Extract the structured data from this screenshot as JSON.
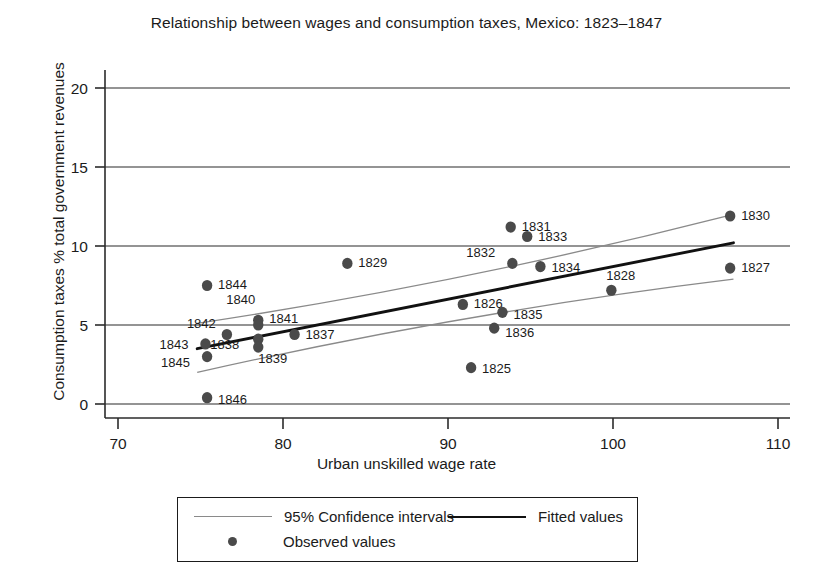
{
  "chart_data": {
    "type": "scatter",
    "title": "Relationship between wages and consumption taxes, Mexico: 1823–1847",
    "xlabel": "Urban unskilled wage rate",
    "ylabel": "Consumption taxes % total government revenues",
    "xlim": [
      70,
      110
    ],
    "ylim": [
      0,
      20
    ],
    "xticks": [
      "70",
      "80",
      "90",
      "100",
      "110"
    ],
    "yticks": [
      "0",
      "5",
      "10",
      "15",
      "20"
    ],
    "grid": "horizontal",
    "legend_position": "below-axes",
    "point_color": "#4a4a4a",
    "fit_color": "#111111",
    "ci_color": "#8a8a8a",
    "points": [
      {
        "label": "1825",
        "x": 91.4,
        "y": 2.3
      },
      {
        "label": "1826",
        "x": 90.9,
        "y": 6.3
      },
      {
        "label": "1827",
        "x": 107.1,
        "y": 8.6
      },
      {
        "label": "1828",
        "x": 99.9,
        "y": 7.2
      },
      {
        "label": "1829",
        "x": 83.9,
        "y": 8.9
      },
      {
        "label": "1830",
        "x": 107.1,
        "y": 11.9
      },
      {
        "label": "1831",
        "x": 93.8,
        "y": 11.2
      },
      {
        "label": "1832",
        "x": 93.9,
        "y": 8.9
      },
      {
        "label": "1833",
        "x": 94.8,
        "y": 10.6
      },
      {
        "label": "1834",
        "x": 95.6,
        "y": 8.7
      },
      {
        "label": "1835",
        "x": 93.3,
        "y": 5.8
      },
      {
        "label": "1836",
        "x": 92.8,
        "y": 4.8
      },
      {
        "label": "1837",
        "x": 80.7,
        "y": 4.4
      },
      {
        "label": "1838",
        "x": 78.5,
        "y": 4.1
      },
      {
        "label": "1839",
        "x": 78.5,
        "y": 3.6
      },
      {
        "label": "1840",
        "x": 78.5,
        "y": 5.3
      },
      {
        "label": "1841",
        "x": 78.5,
        "y": 5.0
      },
      {
        "label": "1842",
        "x": 76.6,
        "y": 4.4
      },
      {
        "label": "1843",
        "x": 75.3,
        "y": 3.8
      },
      {
        "label": "1844",
        "x": 75.4,
        "y": 7.5
      },
      {
        "label": "1845",
        "x": 75.4,
        "y": 3.0
      },
      {
        "label": "1846",
        "x": 75.4,
        "y": 0.4
      }
    ],
    "label_offsets": {
      "1825": [
        11,
        5
      ],
      "1826": [
        11,
        4
      ],
      "1827": [
        11,
        4
      ],
      "1828": [
        -5,
        -10
      ],
      "1829": [
        11,
        4
      ],
      "1830": [
        11,
        4
      ],
      "1831": [
        11,
        4
      ],
      "1832": [
        -46,
        -6
      ],
      "1833": [
        11,
        4
      ],
      "1834": [
        11,
        5
      ],
      "1835": [
        11,
        7
      ],
      "1836": [
        11,
        9
      ],
      "1837": [
        11,
        5
      ],
      "1838": [
        -48,
        10
      ],
      "1839": [
        0,
        16
      ],
      "1840": [
        -32,
        -16
      ],
      "1841": [
        11,
        -2
      ],
      "1842": [
        -40,
        -6
      ],
      "1843": [
        -46,
        5
      ],
      "1844": [
        11,
        3
      ],
      "1845": [
        -46,
        10
      ],
      "1846": [
        11,
        6
      ]
    },
    "fitted_line": {
      "x1": 74.8,
      "y1": 3.5,
      "x2": 107.3,
      "y2": 10.2
    },
    "ci_upper": {
      "x1": 74.8,
      "y1": 5.1,
      "x2": 107.3,
      "y2": 12.0
    },
    "ci_lower": {
      "x1": 74.8,
      "y1": 2.0,
      "x2": 107.3,
      "y2": 7.9
    },
    "legend": [
      {
        "key": "ci",
        "marker": "line-thin",
        "label": "95% Confidence intervals"
      },
      {
        "key": "fit",
        "marker": "line-thick",
        "label": "Fitted values"
      },
      {
        "key": "obs",
        "marker": "dot",
        "label": "Observed values"
      }
    ]
  }
}
